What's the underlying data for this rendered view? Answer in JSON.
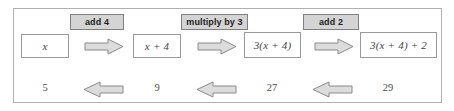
{
  "diagram": {
    "frame_border_color": "#b0b0b0",
    "chip_fill_color": "#d4d4d4",
    "chip_border_color": "#808080",
    "arrow_fill_color": "#dcdcdc",
    "arrow_stroke_color": "#8a8a8a",
    "forward_row": {
      "expressions": [
        {
          "text": "x",
          "italic": true
        },
        {
          "text": "x + 4",
          "italic": true
        },
        {
          "text": "3(x + 4)",
          "italic": true
        },
        {
          "text": "3(x + 4) + 2",
          "italic": true
        }
      ],
      "operations": [
        {
          "label": "add 4"
        },
        {
          "label": "multiply by 3"
        },
        {
          "label": "add 2"
        }
      ],
      "arrow_direction": "right"
    },
    "reverse_row": {
      "values": [
        "5",
        "9",
        "27",
        "29"
      ],
      "arrow_direction": "left"
    }
  }
}
